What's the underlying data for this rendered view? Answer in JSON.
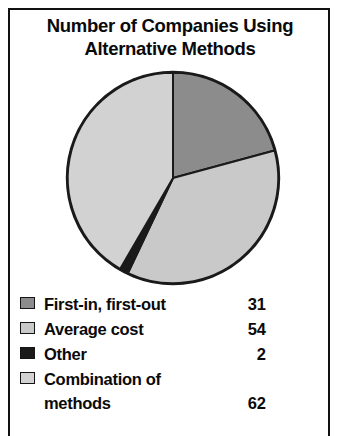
{
  "title": {
    "line1": "Number of Companies Using",
    "line2": "Alternative Methods"
  },
  "legend": {
    "items": [
      {
        "label": "First-in, first-out",
        "value": "31",
        "swatch_name": "legend-swatch-first-in-first-out",
        "color": "#8c8c8c"
      },
      {
        "label": "Average cost",
        "value": "54",
        "swatch_name": "legend-swatch-average-cost",
        "color": "#c9c9c9"
      },
      {
        "label": "Other",
        "value": "2",
        "swatch_name": "legend-swatch-other",
        "color": "#1a1a1a"
      },
      {
        "label": "Combination of\nmethods",
        "value": "62",
        "swatch_name": "legend-swatch-combination-of-methods",
        "color": "#d2d2d2"
      }
    ]
  },
  "chart_data": {
    "type": "pie",
    "title": "Number of Companies Using Alternative Methods",
    "xlabel": "",
    "ylabel": "",
    "categories": [
      "First-in, first-out",
      "Average cost",
      "Other",
      "Combination of methods"
    ],
    "values": [
      31,
      54,
      2,
      62
    ],
    "total": 149,
    "units": "companies",
    "start_angle_deg": 0,
    "direction": "clockwise",
    "legend_position": "below",
    "grid": false,
    "colors": [
      "#8c8c8c",
      "#c9c9c9",
      "#1a1a1a",
      "#d2d2d2"
    ],
    "slice_outline_color": "#1a1a1a",
    "slices": [
      {
        "name": "First-in, first-out",
        "value": 31,
        "percent": 20.8,
        "color": "#8c8c8c",
        "start_deg": 0,
        "end_deg": 74.9
      },
      {
        "name": "Average cost",
        "value": 54,
        "percent": 36.2,
        "color": "#c9c9c9",
        "start_deg": 74.9,
        "end_deg": 205.4
      },
      {
        "name": "Other",
        "value": 2,
        "percent": 1.3,
        "color": "#1a1a1a",
        "start_deg": 205.4,
        "end_deg": 210.2
      },
      {
        "name": "Combination of methods",
        "value": 62,
        "percent": 41.6,
        "color": "#d2d2d2",
        "start_deg": 210.2,
        "end_deg": 360
      }
    ]
  }
}
